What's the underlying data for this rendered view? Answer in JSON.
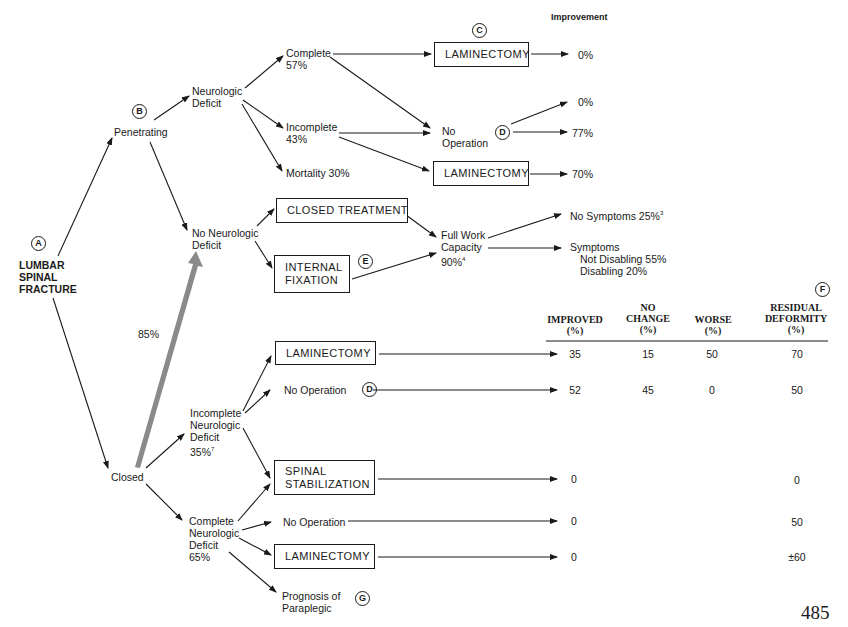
{
  "title": "LUMBAR\nSPINAL\nFRACTURE",
  "markers": {
    "A": "A",
    "B": "B",
    "C": "C",
    "D": "D",
    "E": "E",
    "F": "F",
    "G": "G"
  },
  "improvement_header": "Improvement",
  "penetrating": {
    "label": "Penetrating",
    "neurologic_deficit": "Neurologic\nDeficit",
    "complete": "Complete\n57%",
    "incomplete": "Incomplete\n43%",
    "mortality": "Mortality 30%",
    "laminectomy_top": "LAMINECTOMY",
    "no_operation": "No\nOperation",
    "laminectomy_bottom": "LAMINECTOMY",
    "outcomes": {
      "complete_laminectomy": "0%",
      "no_op_a": "0%",
      "no_op_b": "77%",
      "incomplete_laminectomy": "70%"
    }
  },
  "no_neuro": {
    "label": "No Neurologic\nDeficit",
    "closed_treatment": "CLOSED TREATMENT",
    "internal_fixation": "INTERNAL\nFIXATION",
    "full_work": "Full Work\nCapacity\n90%",
    "full_work_sup": "4",
    "no_symptoms": "No Symptoms 25%",
    "no_symptoms_sup": "3",
    "symptoms": "Symptoms",
    "not_disabling": "Not Disabling 55%",
    "disabling": "Disabling 20%"
  },
  "closed": {
    "label": "Closed",
    "big_arrow_pct": "85%",
    "incomplete": "Incomplete\nNeurologic\nDeficit\n35%",
    "incomplete_sup": "7",
    "laminectomy": "LAMINECTOMY",
    "no_operation": "No Operation",
    "spinal_stabilization": "SPINAL\nSTABILIZATION",
    "complete": "Complete\nNeurologic\nDeficit\n65%",
    "no_operation_2": "No Operation",
    "laminectomy_2": "LAMINECTOMY",
    "prognosis": "Prognosis of\nParaplegic"
  },
  "table": {
    "headers": [
      "IMPROVED\n(%)",
      "NO\nCHANGE\n(%)",
      "WORSE\n(%)",
      "RESIDUAL\nDEFORMITY\n(%)"
    ],
    "rows": [
      {
        "label": "Incomplete - Laminectomy",
        "improved": "35",
        "no_change": "15",
        "worse": "50",
        "residual": "70"
      },
      {
        "label": "Incomplete - No Operation",
        "improved": "52",
        "no_change": "45",
        "worse": "0",
        "residual": "50"
      },
      {
        "label": "Spinal Stabilization",
        "improved": "0",
        "no_change": "",
        "worse": "",
        "residual": "0"
      },
      {
        "label": "Complete - No Operation",
        "improved": "0",
        "no_change": "",
        "worse": "",
        "residual": "50"
      },
      {
        "label": "Complete - Laminectomy",
        "improved": "0",
        "no_change": "",
        "worse": "",
        "residual": "±60"
      }
    ]
  },
  "page_number": "485"
}
